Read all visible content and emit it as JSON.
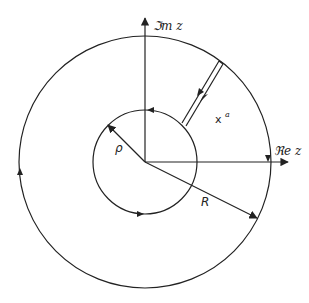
{
  "diagram": {
    "type": "complex-plane contour (annulus with slit)",
    "center": [
      145,
      162
    ],
    "outer_radius_px": 126,
    "inner_radius_px": 52,
    "labels": {
      "imag_axis": "ℑm z",
      "real_axis": "ℜe z",
      "inner_radius": "ρ",
      "outer_radius": "R",
      "point": "x",
      "point_superscript": "a"
    },
    "contours": [
      {
        "name": "outer-circle",
        "radius": "R",
        "orientation": "counter-clockwise"
      },
      {
        "name": "inner-circle",
        "radius": "ρ",
        "orientation": "counter-clockwise"
      },
      {
        "name": "slit",
        "description": "parallel cut from inner to outer circle, traversed in opposite directions"
      }
    ],
    "colors": {
      "stroke": "#222222",
      "background": "#ffffff"
    }
  }
}
